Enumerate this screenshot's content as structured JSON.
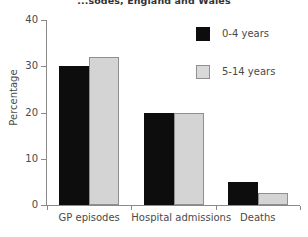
{
  "chart_data": {
    "type": "bar",
    "title": "...sodes, England and Wales",
    "xlabel": "",
    "ylabel": "Percentage",
    "categories": [
      "GP episodes",
      "Hospital admissions",
      "Deaths"
    ],
    "series": [
      {
        "name": "0-4 years",
        "color": "#0d0d0d",
        "values": [
          30,
          20,
          5
        ]
      },
      {
        "name": "5-14 years",
        "color": "#d4d4d4",
        "values": [
          32,
          20,
          2.5
        ]
      }
    ],
    "ylim": [
      0,
      40
    ],
    "yticks": [
      0,
      10,
      20,
      30,
      40
    ],
    "ytick_labels": [
      "0",
      "10",
      "20",
      "30",
      "40"
    ],
    "grid": false,
    "legend_position": "upper right"
  }
}
